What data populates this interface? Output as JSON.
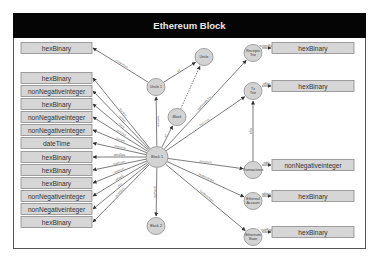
{
  "title": "Ethereum Block",
  "left_boxes": [
    {
      "label": "hexBinary",
      "edge": "ommerHash"
    },
    {
      "label": "hexBinary",
      "edge": "hasHash"
    },
    {
      "label": "nonNegativeinteger",
      "edge": "number"
    },
    {
      "label": "hexBinary",
      "edge": "nonce"
    },
    {
      "label": "nonNegativeinteger",
      "edge": "gasUsed"
    },
    {
      "label": "nonNegativeinteger",
      "edge": "gasLimit"
    },
    {
      "label": "dateTime",
      "edge": "timestamp"
    },
    {
      "label": "hexBinary",
      "edge": "extraData"
    },
    {
      "label": "hexBinary",
      "edge": "logsBloom"
    },
    {
      "label": "hexBinary",
      "edge": "mixHash"
    },
    {
      "label": "nonNegativeinteger",
      "edge": "difficulty"
    },
    {
      "label": "nonNegativeinteger",
      "edge": "size"
    },
    {
      "label": "hexBinary",
      "edge": "beneficiary"
    }
  ],
  "nodes": {
    "uncle1": "Uncle 1",
    "uncle": "Uncle",
    "block": "Block",
    "block1": "Block 1",
    "block2": "Block 2",
    "receipts_trie": [
      "Receipts",
      "Trie"
    ],
    "tx_trie": [
      "Tx",
      "Trie"
    ],
    "transactions": "Transactions",
    "ether_account": [
      "Ethereal",
      "Account"
    ],
    "ethereum_state": [
      "Ethereum",
      "State"
    ]
  },
  "right_boxes": [
    {
      "label": "hexBinary",
      "edge": "receiptsRoot"
    },
    {
      "label": "hexBinary",
      "edge": "txRoot"
    },
    {
      "label": "nonNegativeinteger",
      "edge": "index"
    },
    {
      "label": "hexBinary",
      "edge": "address"
    },
    {
      "label": "hexBinary",
      "edge": "stateRoot"
    }
  ],
  "center_edges": {
    "block1_uncle1": "hasUncle",
    "block1_block": "isA",
    "uncle1_uncle": "isA",
    "block1_block2": "hasParent",
    "block1_receipts": "hasReceiptsTrie",
    "block1_txtrie": "hasTxTrie",
    "block1_transactions": "containsTx",
    "block1_account": "hasBeneficiary",
    "block1_state": "hasWorldState",
    "transactions_txtrie": "inTrie"
  }
}
